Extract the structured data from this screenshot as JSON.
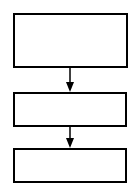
{
  "diagram": {
    "type": "flowchart",
    "direction": "top-to-bottom",
    "stroke_color": "#000000",
    "fill_color": "#ffffff",
    "nodes": [
      {
        "id": "box1",
        "label": "",
        "x": 13,
        "y": 13,
        "w": 115,
        "h": 55
      },
      {
        "id": "box2",
        "label": "",
        "x": 13,
        "y": 92,
        "w": 114,
        "h": 35
      },
      {
        "id": "box3",
        "label": "",
        "x": 13,
        "y": 148,
        "w": 114,
        "h": 35
      }
    ],
    "edges": [
      {
        "from": "box1",
        "to": "box2",
        "label": ""
      },
      {
        "from": "box2",
        "to": "box3",
        "label": ""
      }
    ]
  }
}
